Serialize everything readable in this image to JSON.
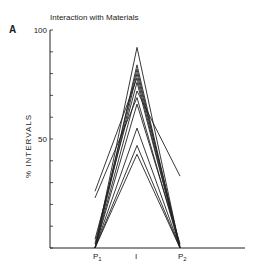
{
  "chart_data": {
    "type": "line",
    "panel_label": "A",
    "title": "Interaction with Materials",
    "xlabel": "",
    "ylabel": "% INTERVALS",
    "categories": [
      "P1",
      "I",
      "P2"
    ],
    "category_labels": [
      {
        "base": "P",
        "sub": "1"
      },
      {
        "base": "I",
        "sub": ""
      },
      {
        "base": "P",
        "sub": "2"
      }
    ],
    "ylim": [
      0,
      100
    ],
    "yticks": [
      0,
      10,
      20,
      30,
      40,
      50,
      60,
      70,
      80,
      90,
      100
    ],
    "ytick_labels": [
      {
        "value": 50,
        "label": "50"
      },
      {
        "value": 100,
        "label": "100"
      }
    ],
    "grid": false,
    "line_color": "#222222",
    "series": [
      {
        "name": "subject-1",
        "values": [
          0,
          92,
          0
        ]
      },
      {
        "name": "subject-2",
        "values": [
          0,
          84,
          0
        ]
      },
      {
        "name": "subject-3",
        "values": [
          2,
          82,
          0
        ]
      },
      {
        "name": "subject-4",
        "values": [
          0,
          80,
          1
        ]
      },
      {
        "name": "subject-5",
        "values": [
          26,
          78,
          0
        ]
      },
      {
        "name": "subject-6",
        "values": [
          4,
          76,
          0
        ]
      },
      {
        "name": "subject-7",
        "values": [
          0,
          72,
          33
        ]
      },
      {
        "name": "subject-8",
        "values": [
          23,
          69,
          0
        ]
      },
      {
        "name": "subject-9",
        "values": [
          0,
          66,
          2
        ]
      },
      {
        "name": "subject-10",
        "values": [
          0,
          55,
          0
        ]
      },
      {
        "name": "subject-11",
        "values": [
          0,
          47,
          0
        ]
      },
      {
        "name": "subject-12",
        "values": [
          0,
          43,
          0
        ]
      }
    ]
  }
}
